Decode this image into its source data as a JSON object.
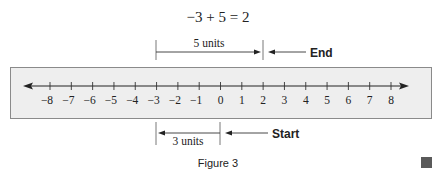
{
  "equation": "−3 + 5 = 2",
  "top_bracket": {
    "label": "5 units",
    "from": -3,
    "to": 2,
    "callout": "End",
    "callout_at": 2
  },
  "bottom_bracket": {
    "label": "3 units",
    "from": 0,
    "to": -3,
    "callout": "Start",
    "callout_at": 0
  },
  "number_line": {
    "min": -8,
    "max": 8,
    "tick_labels": [
      "−8",
      "−7",
      "−6",
      "−5",
      "−4",
      "−3",
      "−2",
      "−1",
      "0",
      "1",
      "2",
      "3",
      "4",
      "5",
      "6",
      "7",
      "8"
    ],
    "arrows": "both"
  },
  "caption": "Figure 3",
  "colors": {
    "box_fill": "#eeeeee",
    "box_border": "#8a8a8a",
    "line": "#333333",
    "text": "#222222",
    "marker_square": "#5a5a5a"
  }
}
